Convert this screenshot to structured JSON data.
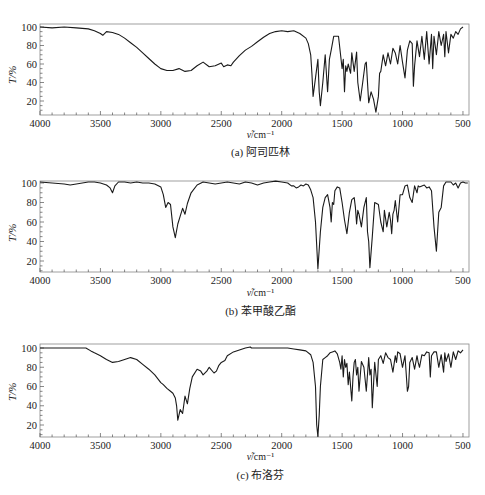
{
  "figure": {
    "panels": [
      {
        "id": "a",
        "caption": "(a) 阿司匹林",
        "ylabel": "T/%",
        "xlabel_symbol": "ν̃",
        "xlabel_unit": "/cm⁻¹"
      },
      {
        "id": "b",
        "caption": "(b) 苯甲酸乙酯",
        "ylabel": "T/%",
        "xlabel_symbol": "ν̃",
        "xlabel_unit": "/cm⁻¹"
      },
      {
        "id": "c",
        "caption": "(c) 布洛芬",
        "ylabel": "T/%",
        "xlabel_symbol": "ν̃",
        "xlabel_unit": "/cm⁻¹"
      }
    ],
    "x_ticks": [
      "4000",
      "3500",
      "3000",
      "2500",
      "2000",
      "1500",
      "1000",
      "500"
    ],
    "y_ticks": [
      "100",
      "80",
      "60",
      "40",
      "20"
    ]
  },
  "chart_data": [
    {
      "type": "line",
      "title": "(a) 阿司匹林",
      "xlabel": "ν̃/cm⁻¹",
      "ylabel": "T/%",
      "xlim": [
        4000,
        450
      ],
      "ylim": [
        5,
        102
      ],
      "grid": false,
      "series": [
        {
          "name": "阿司匹林",
          "x": [
            4000,
            3900,
            3800,
            3700,
            3600,
            3550,
            3500,
            3480,
            3450,
            3400,
            3350,
            3300,
            3250,
            3200,
            3150,
            3100,
            3050,
            3000,
            2950,
            2900,
            2850,
            2800,
            2750,
            2700,
            2650,
            2600,
            2550,
            2500,
            2480,
            2450,
            2420,
            2400,
            2350,
            2300,
            2250,
            2200,
            2150,
            2100,
            2050,
            2000,
            1950,
            1900,
            1850,
            1800,
            1780,
            1760,
            1750,
            1740,
            1720,
            1700,
            1690,
            1680,
            1660,
            1640,
            1620,
            1605,
            1590,
            1570,
            1550,
            1530,
            1500,
            1490,
            1480,
            1470,
            1460,
            1450,
            1430,
            1420,
            1400,
            1380,
            1370,
            1350,
            1330,
            1310,
            1300,
            1280,
            1260,
            1240,
            1220,
            1200,
            1190,
            1180,
            1160,
            1140,
            1120,
            1100,
            1080,
            1060,
            1040,
            1020,
            1000,
            980,
            960,
            940,
            920,
            910,
            900,
            880,
            860,
            840,
            820,
            800,
            780,
            760,
            750,
            740,
            720,
            700,
            680,
            660,
            650,
            640,
            620,
            600,
            580,
            560,
            540,
            520,
            500,
            480,
            460
          ],
          "values": [
            100,
            99,
            100,
            99,
            98,
            96,
            93,
            91,
            95,
            94,
            92,
            88,
            83,
            78,
            72,
            66,
            60,
            55,
            53,
            53,
            55,
            52,
            53,
            58,
            62,
            57,
            58,
            61,
            57,
            59,
            58,
            62,
            69,
            75,
            79,
            84,
            89,
            93,
            95,
            96,
            95,
            96,
            93,
            88,
            82,
            70,
            50,
            25,
            45,
            65,
            30,
            15,
            40,
            70,
            30,
            65,
            75,
            90,
            90,
            90,
            55,
            65,
            30,
            58,
            52,
            60,
            50,
            72,
            52,
            73,
            40,
            20,
            40,
            60,
            62,
            18,
            30,
            22,
            8,
            25,
            50,
            52,
            70,
            58,
            72,
            60,
            77,
            72,
            60,
            80,
            62,
            45,
            75,
            85,
            82,
            36,
            58,
            85,
            68,
            90,
            65,
            95,
            60,
            92,
            55,
            90,
            70,
            95,
            80,
            92,
            68,
            95,
            72,
            92,
            88,
            95,
            92,
            98,
            100
          ],
          "x_rounded": true
        }
      ]
    },
    {
      "type": "line",
      "title": "(b) 苯甲酸乙酯",
      "xlabel": "ν̃/cm⁻¹",
      "ylabel": "T/%",
      "xlim": [
        4000,
        450
      ],
      "ylim": [
        5,
        102
      ],
      "grid": false,
      "series": [
        {
          "name": "苯甲酸乙酯",
          "x": [
            4000,
            3900,
            3800,
            3750,
            3700,
            3650,
            3600,
            3550,
            3500,
            3450,
            3420,
            3400,
            3380,
            3350,
            3300,
            3250,
            3200,
            3150,
            3100,
            3050,
            3000,
            2980,
            2960,
            2940,
            2920,
            2900,
            2880,
            2860,
            2840,
            2820,
            2800,
            2780,
            2750,
            2700,
            2650,
            2600,
            2550,
            2500,
            2450,
            2400,
            2350,
            2300,
            2250,
            2200,
            2150,
            2100,
            2050,
            2000,
            1950,
            1920,
            1900,
            1880,
            1860,
            1840,
            1820,
            1800,
            1780,
            1760,
            1740,
            1720,
            1700,
            1680,
            1660,
            1640,
            1620,
            1600,
            1590,
            1580,
            1570,
            1560,
            1540,
            1520,
            1500,
            1480,
            1460,
            1440,
            1420,
            1400,
            1390,
            1380,
            1370,
            1360,
            1340,
            1320,
            1300,
            1290,
            1280,
            1270,
            1250,
            1230,
            1200,
            1180,
            1160,
            1150,
            1130,
            1110,
            1100,
            1090,
            1080,
            1070,
            1060,
            1040,
            1020,
            1000,
            980,
            960,
            940,
            920,
            900,
            880,
            870,
            860,
            840,
            820,
            800,
            780,
            760,
            740,
            720,
            700,
            680,
            660,
            640,
            620,
            600,
            580,
            560,
            540,
            520,
            500,
            480,
            460
          ],
          "values": [
            101,
            100,
            99,
            98,
            99,
            100,
            101,
            101,
            100,
            98,
            95,
            90,
            97,
            101,
            101,
            100,
            101,
            100,
            100,
            99,
            96,
            88,
            75,
            80,
            78,
            55,
            44,
            58,
            66,
            74,
            68,
            79,
            90,
            98,
            101,
            100,
            99,
            100,
            101,
            100,
            99,
            101,
            100,
            98,
            100,
            101,
            102,
            101,
            100,
            97,
            97,
            95,
            96,
            98,
            97,
            99,
            98,
            93,
            85,
            60,
            12,
            50,
            75,
            85,
            88,
            75,
            60,
            80,
            78,
            92,
            96,
            95,
            80,
            62,
            48,
            70,
            83,
            85,
            75,
            58,
            72,
            68,
            55,
            75,
            85,
            50,
            40,
            13,
            45,
            80,
            78,
            60,
            50,
            72,
            55,
            70,
            62,
            48,
            68,
            72,
            82,
            60,
            88,
            88,
            97,
            98,
            85,
            80,
            97,
            90,
            97,
            96,
            97,
            98,
            95,
            96,
            92,
            55,
            30,
            70,
            75,
            97,
            101,
            101,
            101,
            98,
            100,
            95,
            100,
            101,
            100,
            100
          ],
          "x_rounded": true
        }
      ]
    },
    {
      "type": "line",
      "title": "(c) 布洛芬",
      "xlabel": "ν̃/cm⁻¹",
      "ylabel": "T/%",
      "xlim": [
        4000,
        450
      ],
      "ylim": [
        5,
        102
      ],
      "grid": false,
      "series": [
        {
          "name": "布洛芬",
          "x": [
            4000,
            3900,
            3800,
            3700,
            3620,
            3580,
            3550,
            3500,
            3450,
            3400,
            3350,
            3300,
            3250,
            3200,
            3150,
            3100,
            3050,
            3000,
            2980,
            2950,
            2920,
            2900,
            2880,
            2870,
            2860,
            2840,
            2820,
            2800,
            2780,
            2760,
            2740,
            2700,
            2670,
            2650,
            2620,
            2600,
            2560,
            2540,
            2520,
            2500,
            2470,
            2450,
            2400,
            2350,
            2300,
            2260,
            2250,
            2200,
            2150,
            2100,
            2050,
            2000,
            1950,
            1900,
            1850,
            1800,
            1760,
            1740,
            1720,
            1710,
            1700,
            1690,
            1680,
            1660,
            1640,
            1620,
            1600,
            1580,
            1560,
            1540,
            1520,
            1510,
            1500,
            1490,
            1480,
            1470,
            1460,
            1450,
            1440,
            1420,
            1410,
            1400,
            1390,
            1380,
            1370,
            1360,
            1340,
            1320,
            1300,
            1280,
            1270,
            1260,
            1250,
            1230,
            1210,
            1200,
            1180,
            1160,
            1140,
            1120,
            1100,
            1080,
            1060,
            1050,
            1040,
            1020,
            1000,
            980,
            960,
            950,
            940,
            920,
            900,
            880,
            870,
            860,
            840,
            820,
            800,
            780,
            770,
            760,
            740,
            720,
            700,
            680,
            660,
            650,
            640,
            620,
            600,
            580,
            560,
            540,
            520,
            500,
            480,
            460
          ],
          "values": [
            100,
            100,
            100,
            100,
            100,
            97,
            95,
            92,
            88,
            85,
            86,
            88,
            90,
            88,
            83,
            78,
            72,
            64,
            62,
            58,
            55,
            53,
            48,
            40,
            25,
            36,
            32,
            50,
            42,
            58,
            70,
            78,
            76,
            72,
            76,
            80,
            74,
            76,
            82,
            85,
            87,
            92,
            96,
            98,
            100,
            101,
            100,
            100,
            100,
            100,
            100,
            100,
            100,
            99,
            98,
            97,
            93,
            85,
            60,
            20,
            8,
            30,
            60,
            88,
            90,
            92,
            95,
            96,
            97,
            94,
            85,
            78,
            92,
            70,
            88,
            80,
            84,
            62,
            75,
            45,
            70,
            85,
            88,
            72,
            80,
            55,
            86,
            80,
            55,
            90,
            72,
            78,
            38,
            85,
            60,
            88,
            92,
            84,
            95,
            90,
            88,
            75,
            92,
            85,
            96,
            94,
            80,
            92,
            55,
            60,
            85,
            90,
            78,
            92,
            85,
            80,
            93,
            92,
            96,
            95,
            70,
            92,
            96,
            96,
            80,
            93,
            75,
            95,
            86,
            94,
            80,
            96,
            88,
            97,
            95,
            98
          ],
          "x_rounded": true
        }
      ]
    }
  ]
}
